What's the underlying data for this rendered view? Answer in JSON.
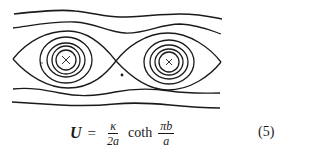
{
  "figure": {
    "vortex_cells": 2,
    "center_marker": "×",
    "colors": {
      "ink": "#1a1a1a",
      "background": "#ffffff"
    }
  },
  "equation": {
    "lhs": "U",
    "equals": "=",
    "frac1_num": "κ",
    "frac1_den": "2a",
    "func": "coth",
    "frac2_num": "πb",
    "frac2_den": "a",
    "number": "(5)"
  }
}
